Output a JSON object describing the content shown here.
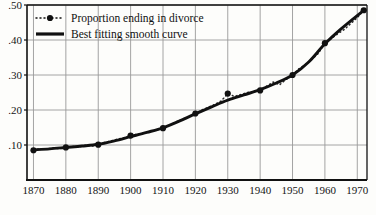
{
  "chart_data": {
    "type": "line",
    "title": "",
    "xlabel": "",
    "ylabel": "",
    "xlim": [
      1868,
      1973
    ],
    "ylim": [
      0.0,
      0.5
    ],
    "grid": true,
    "legend_position": "top-left",
    "x_ticks": [
      "1870",
      "1880",
      "1890",
      "1900",
      "1910",
      "1920",
      "1930",
      "1940",
      "1950",
      "1960",
      "1970"
    ],
    "x_tick_values": [
      1870,
      1880,
      1890,
      1900,
      1910,
      1920,
      1930,
      1940,
      1950,
      1960,
      1970
    ],
    "y_ticks": [
      ".10",
      ".20",
      ".30",
      ".40",
      ".50"
    ],
    "y_tick_values": [
      0.1,
      0.2,
      0.3,
      0.4,
      0.5
    ],
    "series": [
      {
        "name": "Proportion ending in divorce",
        "style": "dotted-with-markers",
        "marker": "filled-circle",
        "color": "#111111",
        "x": [
          1870,
          1880,
          1890,
          1900,
          1910,
          1920,
          1930,
          1940,
          1950,
          1960,
          1972
        ],
        "values": [
          0.085,
          0.093,
          0.101,
          0.127,
          0.148,
          0.19,
          0.247,
          0.256,
          0.3,
          0.391,
          0.485
        ]
      },
      {
        "name": "Best fitting smooth curve",
        "style": "thick-solid",
        "color": "#111111",
        "x": [
          1870,
          1875,
          1880,
          1885,
          1890,
          1895,
          1900,
          1905,
          1910,
          1915,
          1920,
          1925,
          1930,
          1935,
          1940,
          1945,
          1950,
          1955,
          1960,
          1965,
          1972
        ],
        "values": [
          0.086,
          0.089,
          0.093,
          0.097,
          0.102,
          0.112,
          0.124,
          0.136,
          0.149,
          0.168,
          0.189,
          0.209,
          0.228,
          0.243,
          0.258,
          0.277,
          0.3,
          0.337,
          0.389,
          0.432,
          0.485
        ]
      },
      {
        "name": "annual-observations-dotted",
        "style": "fine-dotted",
        "color": "#2a2a2a",
        "x": [
          1870,
          1872,
          1874,
          1876,
          1878,
          1880,
          1882,
          1884,
          1886,
          1888,
          1890,
          1892,
          1894,
          1896,
          1898,
          1900,
          1902,
          1904,
          1906,
          1908,
          1910,
          1912,
          1914,
          1916,
          1918,
          1920,
          1922,
          1924,
          1926,
          1928,
          1930,
          1932,
          1934,
          1936,
          1938,
          1940,
          1942,
          1944,
          1946,
          1948,
          1950,
          1952,
          1954,
          1956,
          1958,
          1960,
          1962,
          1964,
          1966,
          1968,
          1970,
          1972
        ],
        "values": [
          0.085,
          0.09,
          0.088,
          0.092,
          0.089,
          0.093,
          0.096,
          0.094,
          0.099,
          0.097,
          0.101,
          0.107,
          0.112,
          0.117,
          0.121,
          0.127,
          0.131,
          0.134,
          0.139,
          0.143,
          0.148,
          0.157,
          0.166,
          0.174,
          0.181,
          0.19,
          0.2,
          0.208,
          0.216,
          0.226,
          0.247,
          0.239,
          0.244,
          0.25,
          0.252,
          0.256,
          0.268,
          0.28,
          0.272,
          0.287,
          0.3,
          0.318,
          0.33,
          0.345,
          0.362,
          0.391,
          0.404,
          0.418,
          0.43,
          0.447,
          0.464,
          0.485
        ]
      }
    ],
    "legend": [
      {
        "label": "Proportion ending in divorce",
        "marker": "dotted-with-circle"
      },
      {
        "label": "Best fitting smooth curve",
        "marker": "thick-line"
      }
    ],
    "colors": {
      "axis": "#111111",
      "grid": "#9a9a9a",
      "curve": "#111111",
      "background": "#fdfdfb"
    }
  }
}
